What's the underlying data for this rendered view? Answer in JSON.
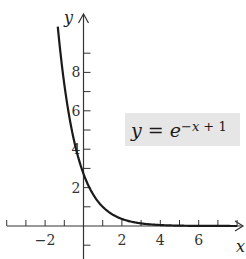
{
  "chart_data": {
    "type": "line",
    "title": "",
    "function": "y = e^(-x+1)",
    "xlabel": "x",
    "ylabel": "y",
    "xlim": [
      -4,
      8.3
    ],
    "ylim": [
      -2,
      11
    ],
    "x_ticks": [
      -4,
      -3,
      -2,
      -1,
      1,
      2,
      3,
      4,
      5,
      6,
      7,
      8
    ],
    "x_tick_labels": [
      "-2",
      "2",
      "4",
      "6"
    ],
    "x_tick_label_values": [
      -2,
      2,
      4,
      6
    ],
    "y_ticks": [
      -1,
      1,
      2,
      3,
      4,
      5,
      6,
      7,
      8,
      9
    ],
    "y_tick_labels": [
      "2",
      "4",
      "6",
      "8"
    ],
    "y_tick_label_values": [
      2,
      4,
      6,
      8
    ],
    "grid": false,
    "series": [
      {
        "name": "y = e^(-x+1)",
        "x": [
          -1.34,
          -1,
          -0.5,
          0,
          0.5,
          1,
          1.5,
          2,
          3,
          4,
          5,
          6,
          7,
          8
        ],
        "values": [
          10.38,
          7.39,
          4.48,
          2.72,
          1.65,
          1.0,
          0.61,
          0.37,
          0.14,
          0.05,
          0.02,
          0.01,
          0.0,
          0.0
        ]
      }
    ],
    "annotations": [
      {
        "text": "y = e^(-x + 1)",
        "position": "upper right, shaded box"
      }
    ]
  },
  "labels": {
    "x_axis": "x",
    "y_axis": "y",
    "eq_lhs": "y",
    "eq_eq": " = ",
    "eq_base": "e",
    "eq_exp_var": "−x",
    "eq_exp_rest": " + 1"
  },
  "colors": {
    "curve": "#1a1a1a",
    "axis": "#333333",
    "label_box": "#e6e6e6"
  }
}
